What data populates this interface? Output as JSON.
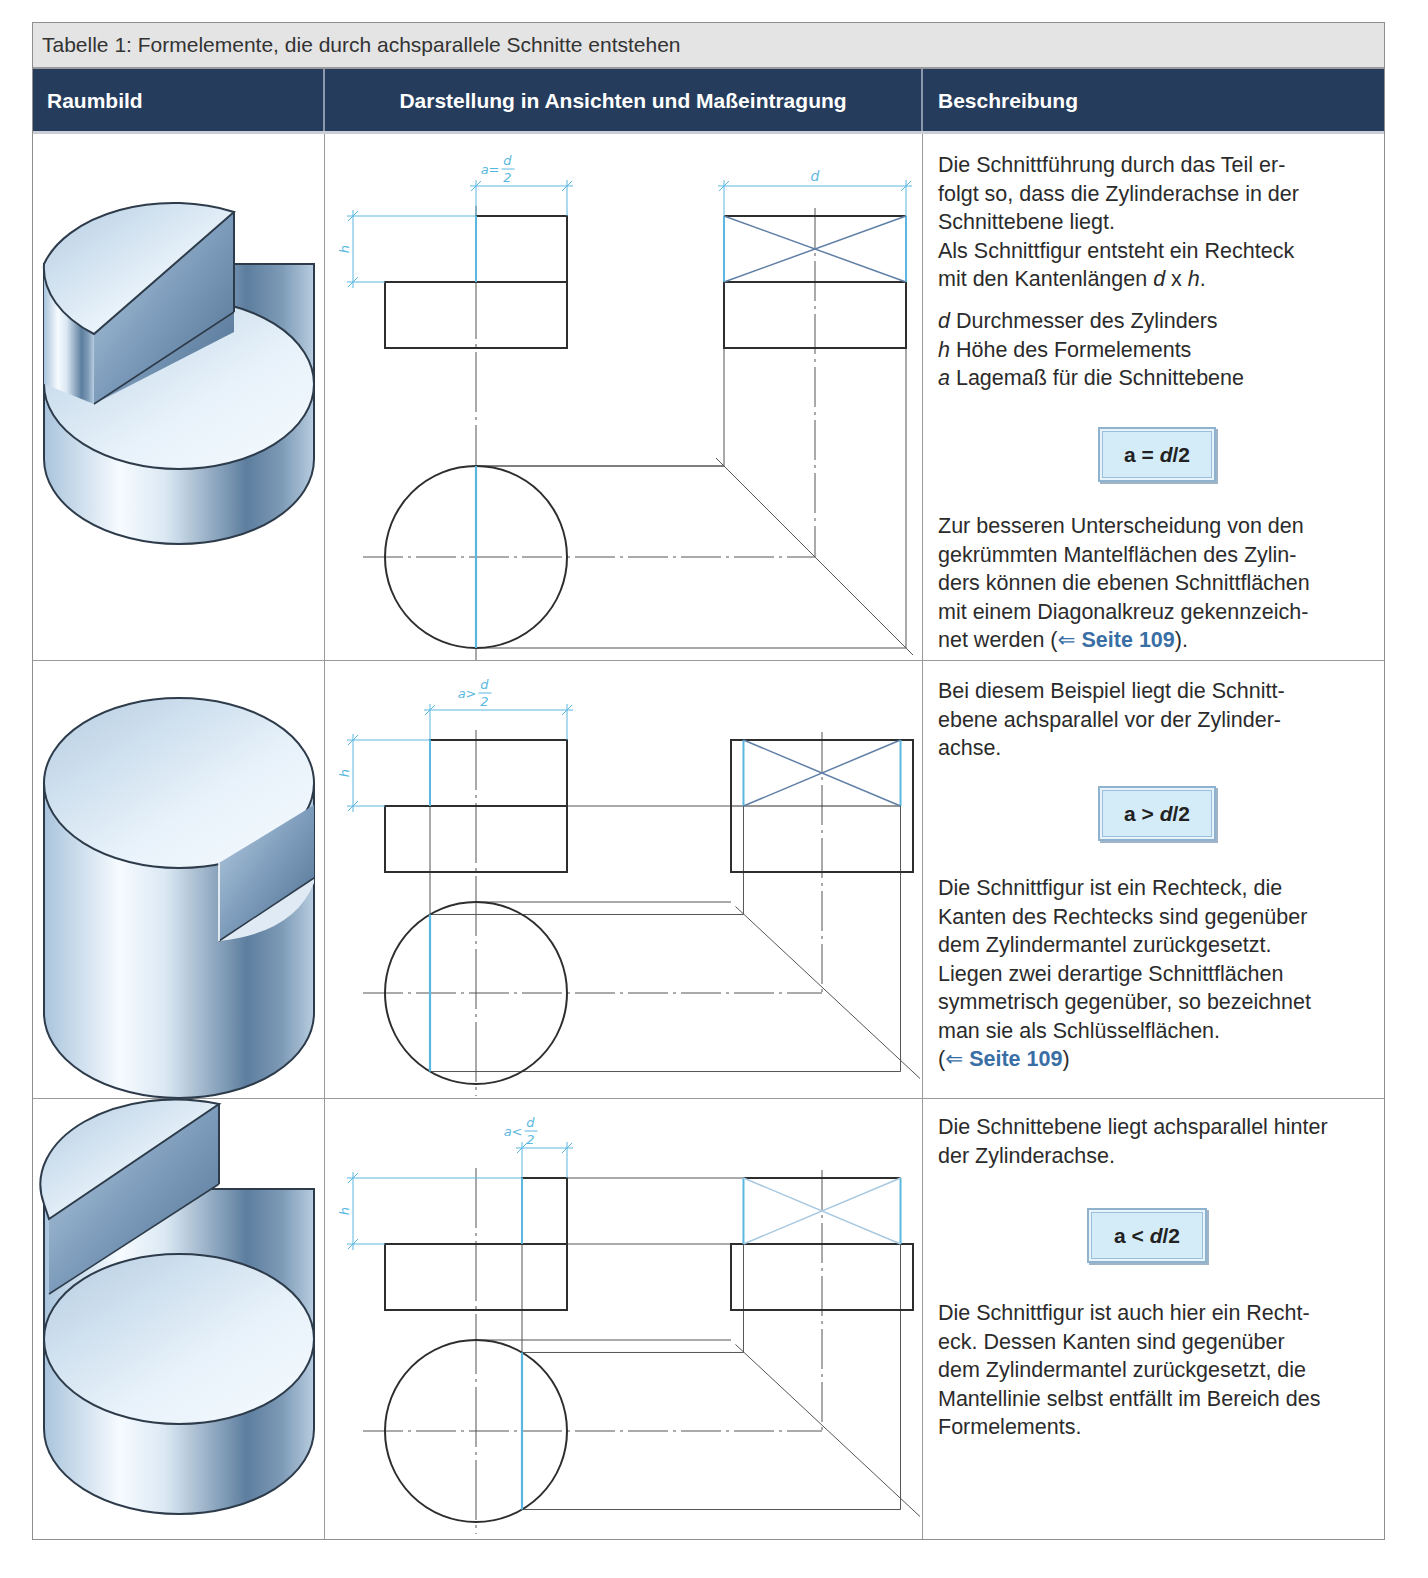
{
  "table": {
    "caption": "Tabelle 1: Formelemente, die durch achsparallele Schnitte entstehen",
    "headers": [
      "Raumbild",
      "Darstellung in Ansichten und Maßeintragung",
      "Beschreibung"
    ],
    "colors": {
      "header_bg": "#263c5c",
      "caption_bg": "#e4e4e4",
      "dimension_blue": "#5ab8e0",
      "link_blue": "#3a6fa5",
      "formula_bg": "#d4ecf8",
      "line": "#333333"
    },
    "rows": [
      {
        "id": "a-equal",
        "height": 527,
        "raumbild": {
          "variant": "a-equal",
          "icon": "cylinder-half-cut-icon"
        },
        "drawing": {
          "dim_a_label": "a = d/2",
          "dim_a_num": "a=",
          "dim_frac_top": "d",
          "dim_frac_bottom": "2",
          "dim_h_label": "h",
          "dim_d_label": "d",
          "cut_offset": 0
        },
        "description": {
          "paragraphs": [
            {
              "segments": [
                {
                  "t": "Die Schnittführung durch das Teil er-\nfolgt so, dass die Zylinderachse in der\nSchnittebene liegt.\nAls Schnittfigur entsteht ein Rechteck\nmit den Kantenlängen "
                },
                {
                  "t": "d",
                  "style": "italic"
                },
                {
                  "t": " x "
                },
                {
                  "t": "h",
                  "style": "italic"
                },
                {
                  "t": "."
                }
              ]
            },
            {
              "segments": [
                {
                  "t": "d",
                  "style": "italic"
                },
                {
                  "t": " Durchmesser des Zylinders\n"
                },
                {
                  "t": "h",
                  "style": "italic"
                },
                {
                  "t": " Höhe des Formelements\n"
                },
                {
                  "t": "a",
                  "style": "italic"
                },
                {
                  "t": " Lagemaß für die Schnittebene"
                }
              ]
            },
            {
              "segments": [
                {
                  "t": "Zur besseren Unterscheidung von den\ngekrümmten Mantelflächen des Zylin-\nders können die ebenen Schnittflächen\nmit einem Diagonalkreuz gekennzeich-\nnet werden ("
                },
                {
                  "t": "⇐ ",
                  "style": "arrow"
                },
                {
                  "t": "Seite 109",
                  "style": "link"
                },
                {
                  "t": ")."
                }
              ]
            }
          ],
          "formula": {
            "a": "a",
            "op": "=",
            "d": "d",
            "rest": "/2"
          }
        }
      },
      {
        "id": "a-greater",
        "height": 438,
        "raumbild": {
          "variant": "a-greater",
          "icon": "cylinder-flat-cut-icon"
        },
        "drawing": {
          "dim_a_label": "a > d/2",
          "dim_a_num": "a>",
          "dim_frac_top": "d",
          "dim_frac_bottom": "2",
          "dim_h_label": "h",
          "cut_offset": -46
        },
        "description": {
          "paragraphs": [
            {
              "segments": [
                {
                  "t": "Bei diesem Beispiel liegt die Schnitt-\nebene achsparallel vor der Zylinder-\nachse."
                }
              ]
            },
            {
              "segments": [
                {
                  "t": "Die Schnittfigur ist ein Rechteck, die\nKanten des Rechtecks sind gegenüber\ndem Zylindermantel zurückgesetzt.\nLiegen zwei derartige Schnittflächen\nsymmetrisch gegenüber, so bezeichnet\nman sie als Schlüsselflächen.\n("
                },
                {
                  "t": "⇐ ",
                  "style": "arrow"
                },
                {
                  "t": "Seite 109",
                  "style": "link"
                },
                {
                  "t": ")"
                }
              ]
            }
          ],
          "formula": {
            "a": "a",
            "op": ">",
            "d": "d",
            "rest": "/2"
          }
        }
      },
      {
        "id": "a-less",
        "height": 440,
        "raumbild": {
          "variant": "a-less",
          "icon": "cylinder-back-cut-icon"
        },
        "drawing": {
          "dim_a_label": "a < d/2",
          "dim_a_num": "a<",
          "dim_frac_top": "d",
          "dim_frac_bottom": "2",
          "dim_h_label": "h",
          "cut_offset": 46
        },
        "description": {
          "paragraphs": [
            {
              "segments": [
                {
                  "t": "Die Schnittebene liegt achsparallel hinter\nder Zylinderachse."
                }
              ]
            },
            {
              "segments": [
                {
                  "t": "Die Schnittfigur ist auch hier ein Recht-\neck. Dessen Kanten sind gegenüber\ndem Zylindermantel zurückgesetzt, die\nMantellinie selbst entfällt im Bereich des\nFormelements."
                }
              ]
            }
          ],
          "formula": {
            "a": "a",
            "op": "<",
            "d": "d",
            "rest": "/2"
          }
        }
      }
    ]
  }
}
